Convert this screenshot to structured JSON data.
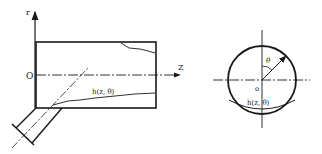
{
  "side_view": {
    "r_axis_label": "r",
    "origin_label": "O",
    "z_axis_label": "Z",
    "clearance_label": "h(z, θ)"
  },
  "end_view": {
    "angle_label": "θ",
    "origin_label": "o",
    "clearance_label": "h(z, θ)"
  },
  "colors": {
    "stroke": "#1a1a1a",
    "background": "#ffffff"
  }
}
